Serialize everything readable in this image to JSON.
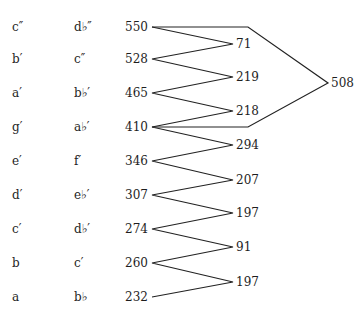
{
  "rows": [
    {
      "note": "c″",
      "enharmonic": "d♭″",
      "value": "550",
      "y": 27
    },
    {
      "note": "b′",
      "enharmonic": "c″",
      "value": "528",
      "y": 59
    },
    {
      "note": "a′",
      "enharmonic": "b♭′",
      "value": "465",
      "y": 93
    },
    {
      "note": "g′",
      "enharmonic": "a♭′",
      "value": "410",
      "y": 127
    },
    {
      "note": "e′",
      "enharmonic": "f′",
      "value": "346",
      "y": 161
    },
    {
      "note": "d′",
      "enharmonic": "e♭′",
      "value": "307",
      "y": 195
    },
    {
      "note": "c′",
      "enharmonic": "d♭′",
      "value": "274",
      "y": 229
    },
    {
      "note": "b",
      "enharmonic": "c′",
      "value": "260",
      "y": 263
    },
    {
      "note": "a",
      "enharmonic": "b♭",
      "value": "232",
      "y": 297
    }
  ],
  "differences": [
    {
      "value": "71",
      "y": 44
    },
    {
      "value": "219",
      "y": 77
    },
    {
      "value": "218",
      "y": 111
    },
    {
      "value": "294",
      "y": 145
    },
    {
      "value": "207",
      "y": 180
    },
    {
      "value": "197",
      "y": 213
    },
    {
      "value": "91",
      "y": 247
    },
    {
      "value": "197",
      "y": 282
    }
  ],
  "outer_difference": {
    "value": "508",
    "y": 83
  }
}
